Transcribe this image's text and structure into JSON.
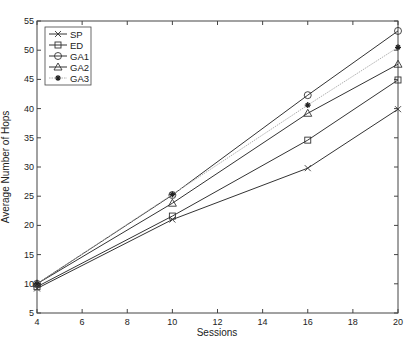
{
  "chart_data": {
    "type": "line",
    "title": "",
    "xlabel": "Sessions",
    "ylabel": "Average Number of Hops",
    "x": [
      4,
      10,
      16,
      20
    ],
    "xlim": [
      4,
      20
    ],
    "ylim": [
      5,
      55
    ],
    "xticks": [
      4,
      6,
      8,
      10,
      12,
      14,
      16,
      18,
      20
    ],
    "yticks": [
      5,
      10,
      15,
      20,
      25,
      30,
      35,
      40,
      45,
      50,
      55
    ],
    "grid": false,
    "legend_position": "upper left",
    "series": [
      {
        "name": "SP",
        "marker": "x",
        "line": "solid",
        "color": "#333333",
        "values": [
          9.2,
          21.0,
          29.8,
          39.9
        ]
      },
      {
        "name": "ED",
        "marker": "square",
        "line": "solid",
        "color": "#333333",
        "values": [
          9.5,
          21.6,
          34.6,
          44.9
        ]
      },
      {
        "name": "GA1",
        "marker": "circle",
        "line": "solid",
        "color": "#333333",
        "values": [
          10.0,
          25.2,
          42.3,
          53.3
        ]
      },
      {
        "name": "GA2",
        "marker": "triangle",
        "line": "solid",
        "color": "#333333",
        "values": [
          10.0,
          23.8,
          39.2,
          47.6
        ]
      },
      {
        "name": "GA3",
        "marker": "asterisk",
        "line": "dotted",
        "color": "#b0b0b0",
        "values": [
          10.0,
          25.3,
          40.6,
          50.5
        ]
      }
    ]
  }
}
